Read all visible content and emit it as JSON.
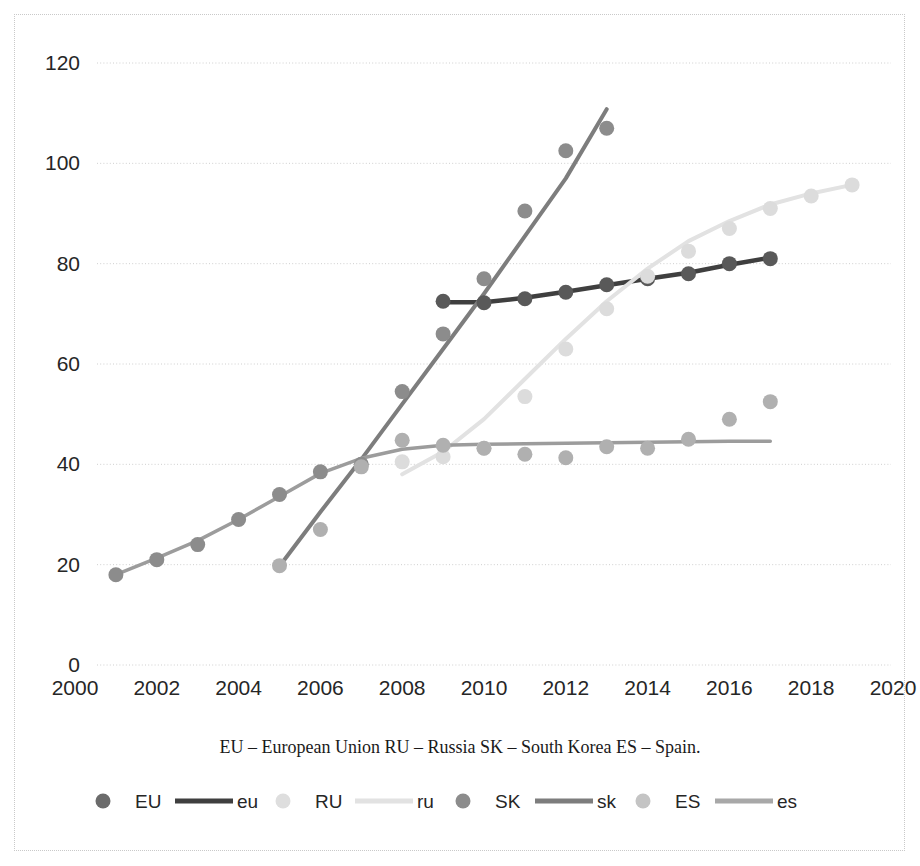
{
  "chart_data": {
    "type": "scatter",
    "title": "",
    "subtitle": "",
    "xlabel": "",
    "ylabel": "",
    "xlim": [
      2000,
      2020
    ],
    "ylim": [
      0,
      120
    ],
    "xticks": [
      "2000",
      "2002",
      "2004",
      "2006",
      "2008",
      "2010",
      "2012",
      "2014",
      "2016",
      "2018",
      "2020"
    ],
    "yticks": [
      "0",
      "20",
      "40",
      "60",
      "80",
      "100",
      "120"
    ],
    "grid": "horizontal-dotted",
    "legend_position": "bottom",
    "caption": "EU – European Union  RU – Russia  SK – South Korea  ES – Spain.",
    "series": [
      {
        "name": "EU",
        "label": "EU",
        "trend_label": "eu",
        "color": "#595959",
        "trend_color": "#404040",
        "x": [
          2009,
          2010,
          2011,
          2012,
          2013,
          2014,
          2015,
          2016,
          2017
        ],
        "values": [
          72.5,
          72.2,
          73.0,
          74.3,
          75.8,
          77.0,
          78.0,
          80.0,
          81.0
        ]
      },
      {
        "name": "RU",
        "label": "RU",
        "trend_label": "ru",
        "color": "#dcdcdc",
        "trend_color": "#e0e0e0",
        "x": [
          2008,
          2009,
          2010,
          2011,
          2012,
          2013,
          2014,
          2015,
          2016,
          2017,
          2018,
          2019
        ],
        "values": [
          40.5,
          41.5,
          43.2,
          53.5,
          63.0,
          71.0,
          77.5,
          82.5,
          87.0,
          91.0,
          93.5,
          95.7
        ]
      },
      {
        "name": "SK",
        "label": "SK",
        "trend_label": "sk",
        "color": "#8c8c8c",
        "trend_color": "#8c8c8c",
        "x": [
          2001,
          2002,
          2003,
          2004,
          2005,
          2006,
          2007,
          2008,
          2009,
          2010,
          2011,
          2012,
          2013
        ],
        "values": [
          18.0,
          21.0,
          24.0,
          29.0,
          34.0,
          38.5,
          40.0,
          54.5,
          66.0,
          77.0,
          90.5,
          102.5,
          107.0
        ]
      },
      {
        "name": "ES",
        "label": "ES",
        "trend_label": "es",
        "color": "#b0b0b0",
        "trend_color": "#9a9a9a",
        "x": [
          2005,
          2006,
          2007,
          2008,
          2009,
          2010,
          2011,
          2012,
          2013,
          2014,
          2015,
          2016,
          2017
        ],
        "values": [
          19.8,
          27.0,
          39.5,
          44.8,
          43.8,
          43.2,
          42.0,
          41.3,
          43.5,
          43.2,
          45.0,
          49.0,
          52.5
        ]
      }
    ],
    "trendlines": [
      {
        "name": "eu",
        "series": "EU",
        "color": "#3f3f3f",
        "width": 4.5,
        "points": [
          [
            2009,
            72.3
          ],
          [
            2010,
            72.3
          ],
          [
            2011,
            73.2
          ],
          [
            2012,
            74.4
          ],
          [
            2013,
            75.7
          ],
          [
            2014,
            77.0
          ],
          [
            2015,
            78.2
          ],
          [
            2016,
            79.8
          ],
          [
            2017,
            81.2
          ]
        ]
      },
      {
        "name": "ru",
        "series": "RU",
        "color": "#e2e2e2",
        "width": 4.0,
        "points": [
          [
            2008,
            38.0
          ],
          [
            2009,
            42.5
          ],
          [
            2010,
            49.0
          ],
          [
            2011,
            57.0
          ],
          [
            2012,
            65.0
          ],
          [
            2013,
            72.5
          ],
          [
            2014,
            79.0
          ],
          [
            2015,
            84.5
          ],
          [
            2016,
            88.5
          ],
          [
            2017,
            91.8
          ],
          [
            2018,
            94.0
          ],
          [
            2019,
            95.7
          ]
        ]
      },
      {
        "name": "sk",
        "series": "SK",
        "color": "#7d7d7d",
        "width": 4.0,
        "points": [
          [
            2005,
            19.7
          ],
          [
            2006,
            30.5
          ],
          [
            2007,
            41.0
          ],
          [
            2008,
            52.0
          ],
          [
            2009,
            63.0
          ],
          [
            2010,
            74.0
          ],
          [
            2011,
            85.5
          ],
          [
            2012,
            97.0
          ],
          [
            2013,
            110.8
          ]
        ]
      },
      {
        "name": "es",
        "series": "ES",
        "color": "#9c9c9c",
        "width": 3.5,
        "points": [
          [
            2001,
            18.0
          ],
          [
            2002,
            21.3
          ],
          [
            2003,
            24.8
          ],
          [
            2004,
            29.0
          ],
          [
            2005,
            33.6
          ],
          [
            2006,
            38.2
          ],
          [
            2007,
            41.2
          ],
          [
            2008,
            43.0
          ],
          [
            2009,
            43.8
          ],
          [
            2010,
            44.0
          ],
          [
            2011,
            44.1
          ],
          [
            2012,
            44.2
          ],
          [
            2013,
            44.3
          ],
          [
            2014,
            44.4
          ],
          [
            2015,
            44.5
          ],
          [
            2016,
            44.6
          ],
          [
            2017,
            44.6
          ]
        ]
      }
    ]
  },
  "legend": {
    "entries": [
      {
        "marker_label": "EU",
        "line_label": "eu",
        "marker_color": "#6b6b6b",
        "line_color": "#3f3f3f"
      },
      {
        "marker_label": "RU",
        "line_label": "ru",
        "marker_color": "#dedede",
        "line_color": "#e2e2e2"
      },
      {
        "marker_label": "SK",
        "line_label": "sk",
        "marker_color": "#8c8c8c",
        "line_color": "#7d7d7d"
      },
      {
        "marker_label": "ES",
        "line_label": "es",
        "marker_color": "#c4c4c4",
        "line_color": "#a8a8a8"
      }
    ]
  },
  "caption": {
    "text": "EU – European Union  RU – Russia  SK – South Korea  ES – Spain."
  }
}
